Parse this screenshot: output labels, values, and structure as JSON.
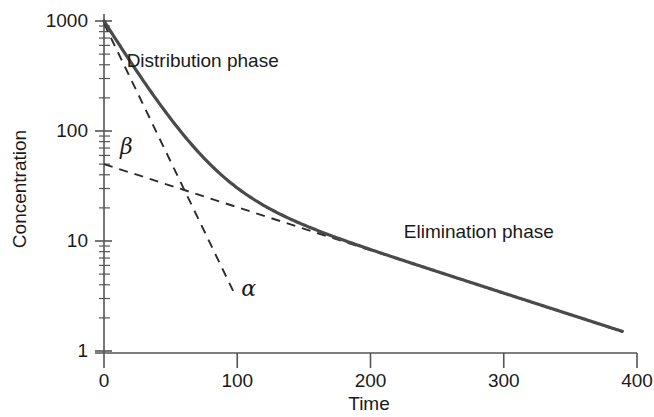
{
  "chart_data": {
    "type": "line",
    "title": "",
    "xlabel": "Time",
    "ylabel": "Concentration",
    "yscale": "log",
    "xscale": "linear",
    "xlim": [
      0,
      400
    ],
    "ylim": [
      1,
      1000
    ],
    "grid": false,
    "legend": "none",
    "xticks": [
      {
        "value": 0,
        "label": "0"
      },
      {
        "value": 100,
        "label": "100"
      },
      {
        "value": 200,
        "label": "200"
      },
      {
        "value": 300,
        "label": "300"
      },
      {
        "value": 400,
        "label": "400"
      }
    ],
    "yticks": [
      {
        "value": 1,
        "label": "1"
      },
      {
        "value": 10,
        "label": "10"
      },
      {
        "value": 100,
        "label": "100"
      },
      {
        "value": 1000,
        "label": "1000"
      }
    ],
    "yminorticks": [
      2,
      3,
      4,
      5,
      6,
      7,
      8,
      9,
      20,
      30,
      40,
      50,
      60,
      70,
      80,
      90,
      200,
      300,
      400,
      500,
      600,
      700,
      800,
      900
    ],
    "series": [
      {
        "name": "observed-concentration-curve",
        "style": "solid",
        "color": "#4a4a4a",
        "model": "biexponential",
        "equation": "C(t) = A*exp(-alpha*t) + B*exp(-beta*t)",
        "A": 950,
        "alpha": 0.0455,
        "B": 50,
        "beta": 0.009,
        "x": [
          0,
          10,
          20,
          30,
          40,
          50,
          60,
          70,
          80,
          90,
          100,
          120,
          140,
          160,
          180,
          200,
          220,
          240,
          260,
          280,
          300,
          320,
          340,
          360,
          389
        ],
        "y": [
          1000,
          647,
          421,
          278,
          188,
          131,
          95,
          73,
          59,
          50,
          44,
          36,
          31,
          26,
          22,
          19,
          16,
          13.6,
          11.6,
          9.8,
          8.4,
          7.1,
          6.0,
          5.1,
          4.1
        ]
      },
      {
        "name": "alpha-residual-line",
        "style": "dashed",
        "color": "#2b2b2b",
        "label": "α",
        "intercept_y": 950,
        "slope_per_unit": -0.0455,
        "x_start": 0,
        "x_end": 98,
        "y_start": 950,
        "y_end": 3.3
      },
      {
        "name": "beta-terminal-line",
        "style": "dashed",
        "color": "#2b2b2b",
        "label": "β",
        "intercept_y": 50,
        "slope_per_unit": -0.009,
        "x_start": 0,
        "x_end": 389,
        "y_start": 50,
        "y_end": 1.5
      }
    ],
    "annotations": [
      {
        "name": "distribution-phase-label",
        "text": "Distribution phase",
        "x": 17,
        "y": 430
      },
      {
        "name": "elimination-phase-label",
        "text": "Elimination phase",
        "x": 225,
        "y": 12
      },
      {
        "name": "alpha-symbol",
        "text": "α",
        "x": 103,
        "y": 3.6
      },
      {
        "name": "beta-symbol",
        "text": "β",
        "x": 12,
        "y": 70
      }
    ],
    "colors": {
      "curve": "#4a4a4a",
      "dashed": "#2b2b2b",
      "axis": "#555555",
      "text": "#1a1a1a",
      "background": "#ffffff"
    }
  }
}
